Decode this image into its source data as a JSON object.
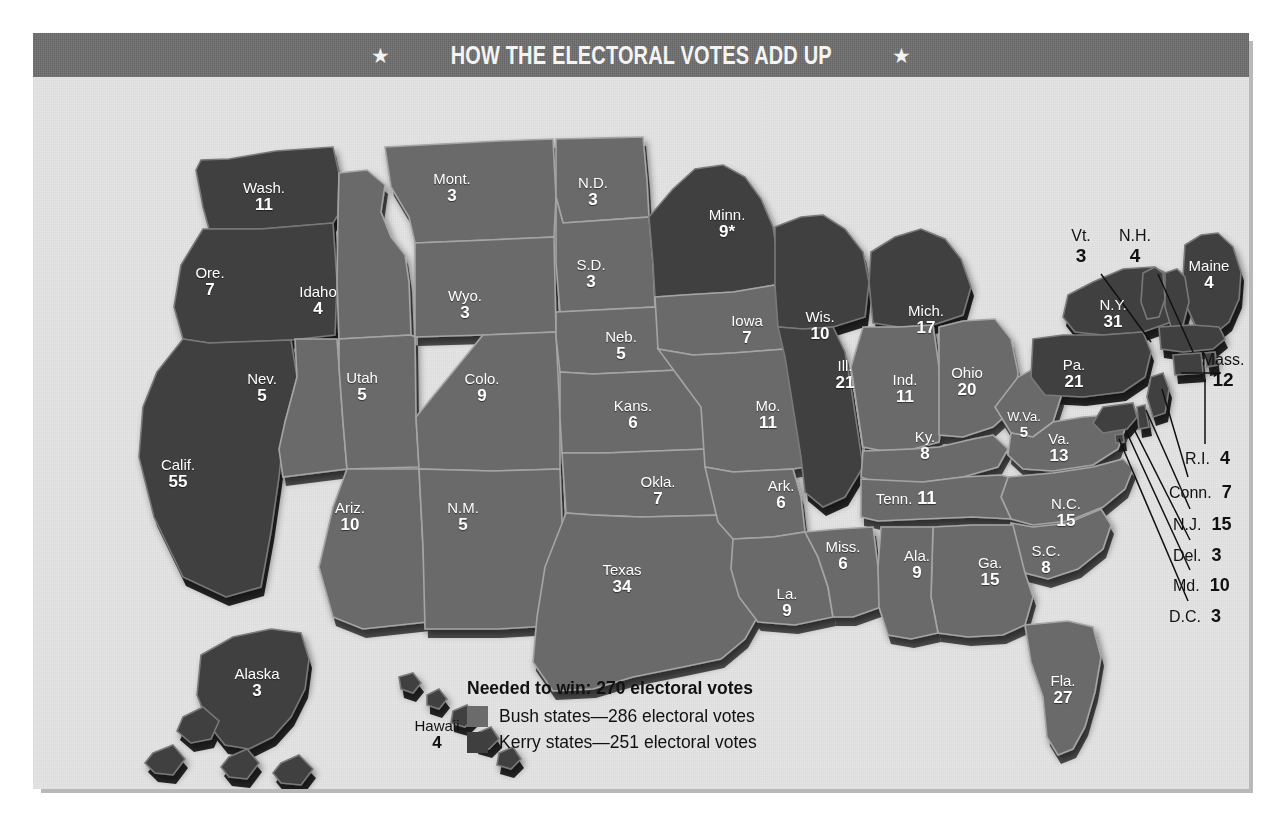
{
  "header": {
    "title": "HOW THE ELECTORAL VOTES ADD UP",
    "star_left": "★",
    "star_right": "★"
  },
  "colors": {
    "bush": "#6b6b6b",
    "kerry": "#3f3f3f",
    "card_bg": "#e3e3e3",
    "header_bg": "#6e6e6e",
    "title_text": "#f4f4f4",
    "label_text": "#ffffff",
    "body_text": "#111111"
  },
  "legend": {
    "needed": "Needed to win: 270 electoral votes",
    "items": [
      {
        "swatch": "#6b6b6b",
        "label": "Bush states—286 electoral votes",
        "party": "bush"
      },
      {
        "swatch": "#3f3f3f",
        "label": "Kerry states—251 electoral votes",
        "party": "kerry"
      }
    ]
  },
  "footnote": "* One of Minnesota's 10 electors voted for John Edwards, not John Kerry.",
  "states": [
    {
      "name": "Wash.",
      "votes": "11",
      "party": "kerry",
      "x": 231,
      "y": 115,
      "style": "stack"
    },
    {
      "name": "Ore.",
      "votes": "7",
      "party": "kerry",
      "x": 177,
      "y": 200,
      "style": "stack"
    },
    {
      "name": "Calif.",
      "votes": "55",
      "party": "kerry",
      "x": 145,
      "y": 392,
      "style": "stack"
    },
    {
      "name": "Idaho",
      "votes": "4",
      "party": "bush",
      "x": 285,
      "y": 219,
      "style": "stack"
    },
    {
      "name": "Nev.",
      "votes": "5",
      "party": "bush",
      "x": 229,
      "y": 306,
      "style": "stack"
    },
    {
      "name": "Mont.",
      "votes": "3",
      "party": "bush",
      "x": 419,
      "y": 106,
      "style": "stack"
    },
    {
      "name": "Wyo.",
      "votes": "3",
      "party": "bush",
      "x": 432,
      "y": 223,
      "style": "stack"
    },
    {
      "name": "Utah",
      "votes": "5",
      "party": "bush",
      "x": 329,
      "y": 305,
      "style": "stack"
    },
    {
      "name": "Colo.",
      "votes": "9",
      "party": "bush",
      "x": 449,
      "y": 306,
      "style": "stack"
    },
    {
      "name": "Ariz.",
      "votes": "10",
      "party": "bush",
      "x": 317,
      "y": 435,
      "style": "stack"
    },
    {
      "name": "N.M.",
      "votes": "5",
      "party": "bush",
      "x": 430,
      "y": 435,
      "style": "stack"
    },
    {
      "name": "N.D.",
      "votes": "3",
      "party": "bush",
      "x": 560,
      "y": 110,
      "style": "stack"
    },
    {
      "name": "S.D.",
      "votes": "3",
      "party": "bush",
      "x": 558,
      "y": 192,
      "style": "stack"
    },
    {
      "name": "Neb.",
      "votes": "5",
      "party": "bush",
      "x": 588,
      "y": 264,
      "style": "stack"
    },
    {
      "name": "Kans.",
      "votes": "6",
      "party": "bush",
      "x": 600,
      "y": 333,
      "style": "stack"
    },
    {
      "name": "Okla.",
      "votes": "7",
      "party": "bush",
      "x": 625,
      "y": 409,
      "style": "stack"
    },
    {
      "name": "Texas",
      "votes": "34",
      "party": "bush",
      "x": 589,
      "y": 497,
      "style": "stack"
    },
    {
      "name": "Minn.",
      "votes": "9*",
      "party": "kerry",
      "x": 694,
      "y": 142,
      "style": "stack"
    },
    {
      "name": "Iowa",
      "votes": "7",
      "party": "bush",
      "x": 714,
      "y": 248,
      "style": "stack"
    },
    {
      "name": "Mo.",
      "votes": "11",
      "party": "bush",
      "x": 735,
      "y": 333,
      "style": "stack"
    },
    {
      "name": "Ark.",
      "votes": "6",
      "party": "bush",
      "x": 748,
      "y": 413,
      "style": "stack"
    },
    {
      "name": "La.",
      "votes": "9",
      "party": "bush",
      "x": 754,
      "y": 521,
      "style": "stack"
    },
    {
      "name": "Miss.",
      "votes": "6",
      "party": "bush",
      "x": 810,
      "y": 474,
      "style": "stack"
    },
    {
      "name": "Wis.",
      "votes": "10",
      "party": "kerry",
      "x": 787,
      "y": 244,
      "style": "stack"
    },
    {
      "name": "Ill.",
      "votes": "21",
      "party": "kerry",
      "x": 812,
      "y": 293,
      "style": "stack"
    },
    {
      "name": "Mich.",
      "votes": "17",
      "party": "kerry",
      "x": 893,
      "y": 238,
      "style": "stack"
    },
    {
      "name": "Ind.",
      "votes": "11",
      "party": "bush",
      "x": 872,
      "y": 307,
      "style": "stack"
    },
    {
      "name": "Ohio",
      "votes": "20",
      "party": "bush",
      "x": 934,
      "y": 300,
      "style": "stack"
    },
    {
      "name": "Ky.",
      "votes": "8",
      "party": "bush",
      "x": 892,
      "y": 364,
      "style": "stack"
    },
    {
      "name": "W.Va.",
      "votes": "5",
      "party": "bush",
      "x": 991,
      "y": 345,
      "style": "stack sm"
    },
    {
      "name": "Va.",
      "votes": "13",
      "party": "bush",
      "x": 1026,
      "y": 366,
      "style": "stack"
    },
    {
      "name": "N.C.",
      "votes": "15",
      "party": "bush",
      "x": 1033,
      "y": 431,
      "style": "stack"
    },
    {
      "name": "S.C.",
      "votes": "8",
      "party": "bush",
      "x": 1013,
      "y": 478,
      "style": "stack"
    },
    {
      "name": "Ga.",
      "votes": "15",
      "party": "bush",
      "x": 957,
      "y": 490,
      "style": "stack"
    },
    {
      "name": "Ala.",
      "votes": "9",
      "party": "bush",
      "x": 884,
      "y": 483,
      "style": "stack"
    },
    {
      "name": "Tenn.",
      "votes": "11",
      "party": "bush",
      "x": 873,
      "y": 424,
      "style": "inline"
    },
    {
      "name": "Fla.",
      "votes": "27",
      "party": "bush",
      "x": 1030,
      "y": 608,
      "style": "stack"
    },
    {
      "name": "N.Y.",
      "votes": "31",
      "party": "kerry",
      "x": 1080,
      "y": 232,
      "style": "stack"
    },
    {
      "name": "Pa.",
      "votes": "21",
      "party": "kerry",
      "x": 1041,
      "y": 292,
      "style": "stack"
    },
    {
      "name": "Maine",
      "votes": "4",
      "party": "kerry",
      "x": 1176,
      "y": 193,
      "style": "stack"
    },
    {
      "name": "Alaska",
      "votes": "3",
      "party": "kerry",
      "x": 224,
      "y": 601,
      "style": "stack"
    },
    {
      "name": "Hawaii",
      "votes": "4",
      "party": "kerry",
      "x": 404,
      "y": 653,
      "style": "stack dark"
    }
  ],
  "callouts": [
    {
      "name": "Vt.",
      "votes": "3",
      "x": 1048,
      "y": 150,
      "style": "stack",
      "line": {
        "x1": 1068,
        "y1": 197,
        "x2": 1118,
        "y2": 265
      }
    },
    {
      "name": "N.H.",
      "votes": "4",
      "x": 1102,
      "y": 150,
      "style": "stack",
      "line": {
        "x1": 1125,
        "y1": 197,
        "x2": 1160,
        "y2": 275
      }
    },
    {
      "name": "Mass.",
      "votes": "12",
      "x": 1190,
      "y": 274,
      "style": "stack",
      "line": {
        "x1": 1188,
        "y1": 296,
        "x2": 1148,
        "y2": 296
      }
    },
    {
      "name": "R.I.",
      "votes": "4",
      "x": 1152,
      "y": 371,
      "style": "row",
      "line": {
        "x1": 1172,
        "y1": 367,
        "x2": 1172,
        "y2": 302
      }
    },
    {
      "name": "Conn.",
      "votes": "7",
      "x": 1136,
      "y": 405,
      "style": "row",
      "line": {
        "x1": 1155,
        "y1": 400,
        "x2": 1129,
        "y2": 312
      }
    },
    {
      "name": "N.J.",
      "votes": "15",
      "x": 1140,
      "y": 437,
      "style": "row",
      "line": {
        "x1": 1157,
        "y1": 432,
        "x2": 1113,
        "y2": 333
      }
    },
    {
      "name": "Del.",
      "votes": "3",
      "x": 1140,
      "y": 468,
      "style": "row",
      "line": {
        "x1": 1157,
        "y1": 463,
        "x2": 1101,
        "y2": 352
      }
    },
    {
      "name": "Md.",
      "votes": "10",
      "x": 1140,
      "y": 498,
      "style": "row",
      "line": {
        "x1": 1157,
        "y1": 493,
        "x2": 1094,
        "y2": 356
      }
    },
    {
      "name": "D.C.",
      "votes": "3",
      "x": 1136,
      "y": 529,
      "style": "row",
      "line": {
        "x1": 1155,
        "y1": 524,
        "x2": 1086,
        "y2": 362
      }
    }
  ]
}
